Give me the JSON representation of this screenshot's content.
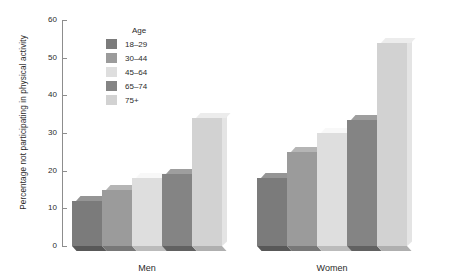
{
  "chart_data": {
    "type": "bar",
    "title": "",
    "xlabel": "",
    "ylabel": "Percentage not participating in physical activity",
    "ylim": [
      0,
      60
    ],
    "yticks": [
      0,
      10,
      20,
      30,
      40,
      50,
      60
    ],
    "grid": false,
    "legend_title": "Age",
    "legend_position": "top-left-inside",
    "categories": [
      "Men",
      "Women"
    ],
    "series": [
      {
        "name": "18–29",
        "color": "#7b7b7b",
        "values": [
          12,
          18
        ]
      },
      {
        "name": "30–44",
        "color": "#9b9b9b",
        "values": [
          15,
          25
        ]
      },
      {
        "name": "45–64",
        "color": "#dedede",
        "values": [
          18,
          30
        ]
      },
      {
        "name": "65–74",
        "color": "#848484",
        "values": [
          19,
          33.5
        ]
      },
      {
        "name": "75+",
        "color": "#d2d2d2",
        "values": [
          34,
          54
        ]
      }
    ]
  },
  "axis": {
    "y_title": "Percentage not participating in physical activity",
    "ticks": [
      "60",
      "50",
      "40",
      "30",
      "20",
      "10",
      "0"
    ]
  },
  "legend": {
    "title": "Age",
    "items": [
      {
        "label": "18–29",
        "color": "#7b7b7b"
      },
      {
        "label": "30–44",
        "color": "#9b9b9b"
      },
      {
        "label": "45–64",
        "color": "#dedede"
      },
      {
        "label": "65–74",
        "color": "#848484"
      },
      {
        "label": "75+",
        "color": "#d2d2d2"
      }
    ]
  },
  "groups": [
    {
      "label": "Men"
    },
    {
      "label": "Women"
    }
  ]
}
